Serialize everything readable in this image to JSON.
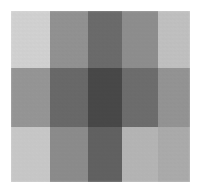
{
  "figure": {
    "background_color": "#ffffff",
    "canvas": {
      "left": 11,
      "top": 11,
      "width": 179,
      "height": 171
    }
  },
  "chart_data": {
    "type": "heatmap",
    "title": "",
    "subtitle": "",
    "xlabel": "",
    "ylabel": "",
    "grid": false,
    "legend_position": "none",
    "colormap": "grayscale",
    "x_categories": [
      "c1",
      "c2",
      "c3",
      "c4",
      "c5"
    ],
    "y_categories": [
      "r1",
      "r2",
      "r3"
    ],
    "column_widths": [
      39,
      38,
      34,
      36,
      32
    ],
    "row_heights": [
      57,
      59,
      55
    ],
    "value_range": [
      68,
      216
    ],
    "values": [
      [
        216,
        150,
        110,
        146,
        198
      ],
      [
        154,
        108,
        74,
        112,
        152
      ],
      [
        206,
        144,
        100,
        186,
        176
      ]
    ],
    "colors": [
      [
        "#d8d8d8",
        "#969696",
        "#6e6e6e",
        "#929292",
        "#c6c6c6"
      ],
      [
        "#9a9a9a",
        "#6c6c6c",
        "#4a4a4a",
        "#707070",
        "#989898"
      ],
      [
        "#cecece",
        "#909090",
        "#646464",
        "#bababa",
        "#b0b0b0"
      ]
    ],
    "cell_labels": [
      [
        "",
        "",
        "",
        "",
        ""
      ],
      [
        "",
        "",
        "",
        "",
        ""
      ],
      [
        "",
        "",
        "",
        "",
        ""
      ]
    ]
  }
}
